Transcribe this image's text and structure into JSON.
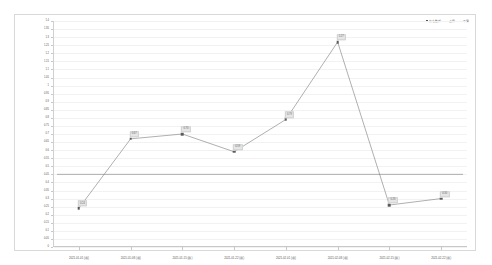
{
  "chart_data": {
    "type": "line",
    "title": "",
    "xlabel": "",
    "ylabel": "",
    "ylim": [
      0,
      1.4
    ],
    "grid": true,
    "legend_position": "top-right",
    "categories": [
      "2021-01-01 (週)",
      "2021-01-08 (週)",
      "2021-01-15 (週)",
      "2021-01-22 (週)",
      "2021-02-01 (週)",
      "2021-02-08 (週)",
      "2021-02-15 (週)",
      "2021-02-22 (週)"
    ],
    "series": [
      {
        "name": "比率",
        "values": [
          0.24,
          0.67,
          0.7,
          0.59,
          0.79,
          1.27,
          0.26,
          0.3
        ],
        "labels": [
          "0.24",
          "0.67",
          "0.70",
          "0.59",
          "0.79",
          "1.27",
          "0.26",
          "0.30"
        ]
      },
      {
        "name": "平均線",
        "type": "reference-line",
        "value": 0.45
      }
    ],
    "yticks": [
      "1.4",
      "1.35",
      "1.3",
      "1.25",
      "1.2",
      "1.15",
      "1.1",
      "1.05",
      "1",
      "0.95",
      "0.9",
      "0.85",
      "0.8",
      "0.75",
      "0.7",
      "0.65",
      "0.6",
      "0.55",
      "0.5",
      "0.45",
      "0.4",
      "0.35",
      "0.3",
      "0.25",
      "0.2",
      "0.15",
      "0.1",
      "0.05",
      "0"
    ],
    "ytick_values": [
      1.4,
      1.35,
      1.3,
      1.25,
      1.2,
      1.15,
      1.1,
      1.05,
      1.0,
      0.95,
      0.9,
      0.85,
      0.8,
      0.75,
      0.7,
      0.65,
      0.6,
      0.55,
      0.5,
      0.45,
      0.4,
      0.35,
      0.3,
      0.25,
      0.2,
      0.15,
      0.1,
      0.05,
      0
    ],
    "colors": {
      "line": "#7a7a7a",
      "marker": "#5a5a5a",
      "reference_line": "#666666",
      "grid": "#f2f2f2",
      "label_background": "#e6e6e6",
      "axis": "#c8c8c8",
      "frame": "#d9d9d9"
    }
  },
  "legend": {
    "entries": [
      {
        "label": "比之數據",
        "marker": "square"
      },
      {
        "label": "上限",
        "marker": "line"
      },
      {
        "label": "下限",
        "marker": "line"
      }
    ]
  }
}
